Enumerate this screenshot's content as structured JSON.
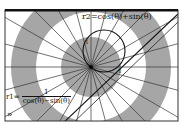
{
  "graph": {
    "type": "polar-graph",
    "center": {
      "x": 91,
      "y": 67
    },
    "rings": [
      {
        "radius": 30,
        "fill": "#a6a6a6"
      },
      {
        "radius": 55,
        "fill": "#ffffff"
      },
      {
        "radius": 80,
        "fill": "#a6a6a6"
      },
      {
        "radius": 110,
        "fill": "#ffffff"
      }
    ],
    "radial_line_count": 24,
    "colors": {
      "ring_gray": "#a6a6a6",
      "line": "#333333",
      "frame": "#111111",
      "background": "#ffffff"
    }
  },
  "equations": {
    "r2": "r2=cos(θ)+sin(θ)",
    "r1_prefix": "r1=",
    "r1_numerator": "1",
    "r1_denominator": "cos(θ)−sin(θ)"
  },
  "axis_labels": {
    "y_tick": "1",
    "x_tick": "1"
  },
  "controls": {
    "expand_label": "»"
  }
}
